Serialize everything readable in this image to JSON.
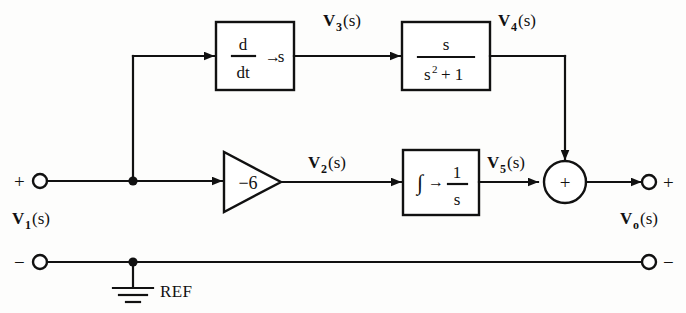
{
  "figure": {
    "background_color": "#fdfdfc",
    "line_color": "#111111"
  },
  "terminals": {
    "input_plus": "+",
    "input_minus": "−",
    "output_plus": "+",
    "output_minus": "−",
    "input_label": {
      "v": "V",
      "sub": "1",
      "paren": "(s)"
    },
    "output_label": {
      "v": "V",
      "sub": "o",
      "paren": "(s)"
    }
  },
  "signals": {
    "v2": {
      "v": "V",
      "sub": "2",
      "paren": "(s)"
    },
    "v3": {
      "v": "V",
      "sub": "3",
      "paren": "(s)"
    },
    "v4": {
      "v": "V",
      "sub": "4",
      "paren": "(s)"
    },
    "v5": {
      "v": "V",
      "sub": "5",
      "paren": "(s)"
    }
  },
  "blocks": {
    "differentiator": {
      "name": "differentiator-block",
      "numerator": "d",
      "denominator": "dt",
      "arrow": "→",
      "equivalent": "s"
    },
    "resonator": {
      "name": "resonator-block",
      "numerator": "s",
      "denominator_base": "s",
      "denominator_exp": "2",
      "denominator_tail": "+ 1"
    },
    "amplifier": {
      "name": "gain-amplifier",
      "gain": "−6"
    },
    "integrator": {
      "name": "integrator-block",
      "symbol": "∫",
      "arrow": "→",
      "numerator": "1",
      "denominator": "s"
    },
    "summer": {
      "name": "summing-junction",
      "sign": "+"
    }
  },
  "ground": {
    "label": "REF"
  }
}
